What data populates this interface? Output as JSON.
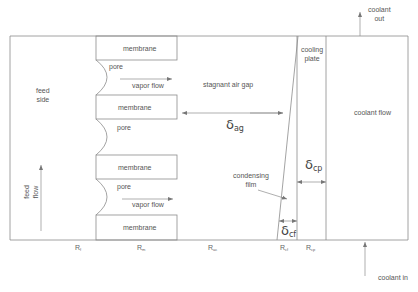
{
  "diagram": {
    "labels": {
      "feed_side": [
        "feed",
        "side"
      ],
      "feed_flow": [
        "feed",
        "flow"
      ],
      "membrane": "membrane",
      "pore": "pore",
      "vapor_flow": "vapor flow",
      "stagnant_air_gap": "stagnant air gap",
      "cooling_plate": [
        "cooling",
        "plate"
      ],
      "coolant_flow": "coolant flow",
      "coolant_out": [
        "coolant",
        "out"
      ],
      "coolant_in": "coolant in",
      "condensing_film": [
        "condensing",
        "film"
      ]
    },
    "thicknesses": {
      "air_gap": {
        "symbol": "δ",
        "sub": "ag"
      },
      "cooling_plate": {
        "symbol": "δ",
        "sub": "cp"
      },
      "condensing_film": {
        "symbol": "δ",
        "sub": "cf"
      }
    },
    "resistances": [
      {
        "symbol": "R",
        "sub": "f"
      },
      {
        "symbol": "R",
        "sub": "m"
      },
      {
        "symbol": "R",
        "sub": "ac"
      },
      {
        "symbol": "R",
        "sub": "cf"
      },
      {
        "symbol": "R",
        "sub": "cp"
      }
    ],
    "colors": {
      "line": "#8c8c8c",
      "text": "#555555",
      "background": "#ffffff"
    }
  }
}
